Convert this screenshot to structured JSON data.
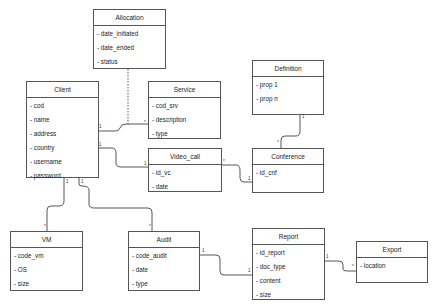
{
  "classes": {
    "allocation": {
      "name": "Allocation",
      "attributes": [
        "- date_initiated",
        "- date_ended",
        "- status"
      ]
    },
    "client": {
      "name": "Client",
      "attributes": [
        "- cod",
        "- name",
        "- address",
        "- country",
        "- username",
        "- password"
      ]
    },
    "service": {
      "name": "Service",
      "attributes": [
        "- cod_srv",
        "- description",
        "- type"
      ]
    },
    "definition": {
      "name": "Definition",
      "attributes": [
        "- prop 1",
        "- prop n"
      ]
    },
    "video_call": {
      "name": "Video_call",
      "attributes": [
        "- id_vc",
        "- date"
      ]
    },
    "conference": {
      "name": "Conference",
      "attributes": [
        "- id_cnf"
      ]
    },
    "vm": {
      "name": "VM",
      "attributes": [
        "- code_vm",
        "- OS",
        "- size"
      ]
    },
    "audit": {
      "name": "Audit",
      "attributes": [
        "- code_audit",
        "- date",
        "- type"
      ]
    },
    "report": {
      "name": "Report",
      "attributes": [
        "- id_report",
        "- doc_type",
        "- content",
        "- size"
      ]
    },
    "export": {
      "name": "Export",
      "attributes": [
        "- location"
      ]
    }
  },
  "multiplicities": {
    "client_service_client": "1",
    "client_service_service": "*",
    "client_videocall_client": "1",
    "client_videocall_videocall": "1",
    "videocall_conference_videocall": "*",
    "videocall_conference_conference": "1",
    "definition_conference_definition": "1",
    "definition_conference_conference": "*",
    "client_vm_client": "1",
    "client_vm_vm": "*",
    "client_audit_client": "1",
    "client_audit_audit": "*",
    "audit_report_audit": "1",
    "audit_report_report": "1",
    "report_export_report": "1",
    "report_export_export": "*"
  }
}
